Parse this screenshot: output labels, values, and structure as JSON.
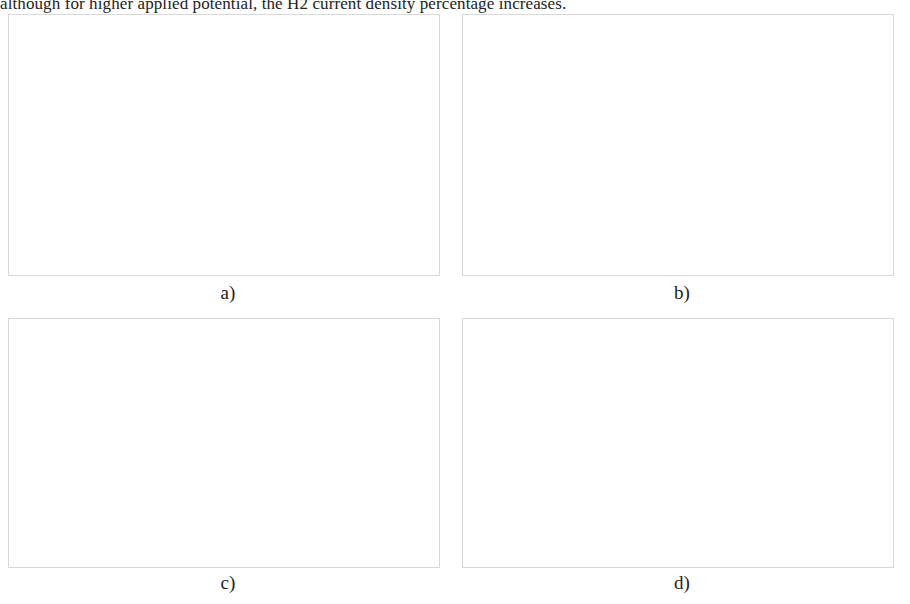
{
  "page": {
    "cropped_text_above": "although for higher applied potential, the H2 current density percentage increases."
  },
  "panels": [
    {
      "key": "a",
      "letter": "a)"
    },
    {
      "key": "b",
      "letter": "b)"
    },
    {
      "key": "c",
      "letter": "c)"
    },
    {
      "key": "d",
      "letter": "d)"
    }
  ],
  "chart_data": [
    {
      "id": "a",
      "type": "scatter",
      "title": "",
      "xlabel": "Applied cathode potential (V)",
      "ylabel": "CO current density (mA/cm²)",
      "xlim": [
        -1.75,
        -0.88
      ],
      "ylim": [
        0,
        100
      ],
      "xticks": [
        -1.7,
        -1.5,
        -1.3,
        -1.1,
        -0.9
      ],
      "xticklabels": [
        "-1.7",
        "-1.5",
        "-1.3",
        "-1.1",
        "-0.9"
      ],
      "yticks": [
        0,
        10,
        20,
        30,
        40,
        50,
        60,
        70,
        80,
        90,
        100
      ],
      "yticklabels": [
        "0",
        "10",
        "20",
        "30",
        "40",
        "50",
        "60",
        "70",
        "80",
        "90",
        "100"
      ],
      "y_axis_side": "right",
      "grid": false,
      "legend_position": "top-center",
      "legend": [
        {
          "label": "Exp Data [Verma et al., 2016]",
          "style": "marker"
        },
        {
          "label": "Model (0.5M KHCO₃)",
          "style": "solid"
        },
        {
          "label": "Model (30% (w/w) MEA)",
          "style": "dashed"
        }
      ],
      "series": [
        {
          "name": "Exp Data [Verma et al., 2016]",
          "style": "marker",
          "x": [
            -1.65,
            -1.54,
            -1.4,
            -1.27,
            -1.13,
            -0.98
          ],
          "y": [
            69,
            47,
            29.5,
            13.5,
            4.5,
            1.5
          ],
          "yerr": [
            9.5,
            6.5,
            3.0,
            0.0,
            0.0,
            0.0
          ]
        },
        {
          "name": "Model (0.5M KHCO₃)",
          "style": "solid",
          "x": [
            -1.7,
            -1.65,
            -1.6,
            -1.55,
            -1.5,
            -1.45,
            -1.4,
            -1.35,
            -1.3,
            -1.25,
            -1.2,
            -1.15,
            -1.1,
            -1.05,
            -1.0,
            -0.96
          ],
          "y": [
            65,
            59,
            53,
            47,
            41,
            35.5,
            30,
            25,
            20.5,
            16,
            12.5,
            9,
            6,
            4,
            2.5,
            2
          ]
        },
        {
          "name": "Model (30% (w/w) MEA)",
          "style": "dashed",
          "x": [
            -1.62,
            -1.58,
            -1.54,
            -1.5,
            -1.46,
            -1.42,
            -1.38,
            -1.34,
            -1.3,
            -1.26,
            -1.22,
            -1.18,
            -1.14,
            -1.1,
            -1.06,
            -1.02,
            -0.98,
            -0.96
          ],
          "y": [
            90,
            82,
            74,
            66,
            58,
            51,
            44,
            38,
            32,
            26.5,
            21.5,
            17,
            13.5,
            10.5,
            8,
            6.5,
            5.5,
            5.5
          ]
        }
      ]
    },
    {
      "id": "b",
      "type": "scatter",
      "title": "",
      "xlabel": "Applied cathode potential (V)",
      "ylabel": "H₂ current density (mA/cm²)",
      "xlim": [
        -1.75,
        -0.88
      ],
      "ylim": [
        0,
        6
      ],
      "xticks": [
        -1.7,
        -1.5,
        -1.3,
        -1.1,
        -0.9
      ],
      "xticklabels": [
        "-1.7",
        "-1.5",
        "-1.3",
        "-1.1",
        "-0.9"
      ],
      "yticks": [
        0,
        1,
        2,
        3,
        4,
        5,
        6
      ],
      "yticklabels": [
        "0",
        "1",
        "2",
        "3",
        "4",
        "5",
        "6"
      ],
      "y_axis_side": "right",
      "grid": false,
      "legend_position": "top-center",
      "legend": [
        {
          "label": "Exp Data [Verma et al., 2016]",
          "style": "marker"
        },
        {
          "label": "Model (0.5M KHCO₃)",
          "style": "solid"
        },
        {
          "label": "Model (30% (w/w) MEA)",
          "style": "dashed"
        }
      ],
      "series": [
        {
          "name": "Exp Data [Verma et al., 2016]",
          "style": "marker",
          "x": [
            -1.65,
            -1.54,
            -1.4,
            -1.27,
            -1.1,
            -0.95
          ],
          "y": [
            1.95,
            1.25,
            1.45,
            0.8,
            0.28,
            0.2
          ],
          "yerr": [
            0.22,
            0.12,
            0.18,
            0.0,
            0.0,
            0.0
          ]
        },
        {
          "name": "Model (0.5M KHCO₃)",
          "style": "solid",
          "x": [
            -1.7,
            -1.65,
            -1.6,
            -1.55,
            -1.5,
            -1.45,
            -1.4,
            -1.35,
            -1.3,
            -1.25,
            -1.2,
            -1.15,
            -1.1,
            -1.05,
            -1.0,
            -0.96
          ],
          "y": [
            2.95,
            2.6,
            2.28,
            1.98,
            1.7,
            1.45,
            1.22,
            1.02,
            0.84,
            0.68,
            0.54,
            0.42,
            0.32,
            0.24,
            0.18,
            0.15
          ]
        },
        {
          "name": "Model (30% (w/w) MEA)",
          "style": "dashed",
          "x": [
            -1.7,
            -1.66,
            -1.62,
            -1.58,
            -1.54,
            -1.5,
            -1.46,
            -1.42,
            -1.38,
            -1.34,
            -1.3,
            -1.25,
            -1.2,
            -1.15,
            -1.1,
            -1.05,
            -1.0,
            -0.96
          ],
          "y": [
            4.95,
            4.3,
            3.7,
            3.12,
            2.58,
            2.05,
            1.62,
            1.28,
            1.0,
            0.8,
            0.64,
            0.5,
            0.38,
            0.28,
            0.2,
            0.15,
            0.11,
            0.09
          ]
        }
      ]
    },
    {
      "id": "c",
      "type": "line",
      "title": "",
      "xlabel": "Feed flowrate (cm³/min)",
      "ylabel": "CO current density (mA/cm²)",
      "y2label": "CO₂ conversion (%)",
      "xlim": [
        0,
        22
      ],
      "ylim": [
        0,
        70
      ],
      "y2lim": [
        0,
        80
      ],
      "xticks": [
        0,
        5,
        10,
        15,
        20
      ],
      "xticklabels": [
        "0",
        "5",
        "10",
        "15",
        "20"
      ],
      "yticks": [
        0,
        10,
        20,
        30,
        40,
        50,
        60,
        70
      ],
      "yticklabels": [
        "0",
        "10",
        "20",
        "30",
        "40",
        "50",
        "60",
        "70"
      ],
      "y2ticks": [
        0,
        10,
        20,
        30,
        40,
        50,
        60,
        70,
        80
      ],
      "y2ticklabels": [
        "0",
        "10",
        "20",
        "30",
        "40",
        "50",
        "60",
        "70",
        "80"
      ],
      "grid": false,
      "legend_position": "center-right",
      "legend": [
        {
          "label": "current (KHCO₃)",
          "style": "solid"
        },
        {
          "label": "current (MEA)",
          "style": "dashed"
        },
        {
          "label": "conversion (KHCO₃)",
          "style": "dashdot"
        },
        {
          "label": "conversion (MEA)",
          "style": "dotted"
        }
      ],
      "series": [
        {
          "name": "current (KHCO₃)",
          "style": "solid",
          "axis": "left",
          "x": [
            2,
            3,
            4,
            5,
            6,
            7,
            8,
            9,
            10,
            11,
            12,
            13,
            14,
            15,
            16,
            17,
            18,
            19,
            20
          ],
          "y": [
            5.5,
            10.5,
            15.5,
            20.0,
            23.0,
            25.0,
            26.5,
            27.6,
            28.5,
            29.2,
            29.8,
            30.3,
            30.7,
            31.0,
            31.3,
            31.6,
            31.8,
            32.0,
            32.2
          ]
        },
        {
          "name": "current (MEA)",
          "style": "dashed",
          "axis": "left",
          "x": [
            2,
            3,
            4,
            5,
            6,
            7,
            8,
            9,
            10,
            11,
            12,
            13,
            14,
            15,
            16,
            17,
            18,
            19,
            20
          ],
          "y": [
            11.5,
            19.0,
            26.5,
            33.5,
            39.5,
            44.0,
            47.5,
            50.5,
            53.0,
            55.0,
            56.5,
            57.8,
            58.8,
            59.5,
            60.1,
            60.5,
            60.8,
            61.0,
            61.1
          ]
        },
        {
          "name": "conversion (KHCO₃)",
          "style": "dashdot",
          "axis": "right",
          "x": [
            2,
            2.5,
            3,
            3.5,
            4,
            5,
            6,
            7,
            8,
            9,
            10,
            11,
            12,
            13,
            14,
            15,
            16,
            17,
            18,
            19,
            20
          ],
          "y": [
            69,
            62,
            54,
            46,
            40,
            31,
            26,
            22,
            19,
            17,
            15.5,
            14,
            13,
            12.2,
            11.6,
            11.1,
            10.7,
            10.4,
            10.2,
            10.05,
            10.0
          ]
        },
        {
          "name": "conversion (MEA)",
          "style": "dotted",
          "axis": "right",
          "x": [
            2,
            2.5,
            3,
            3.5,
            4,
            5,
            6,
            7,
            8,
            9,
            10,
            11,
            12,
            13,
            14,
            15,
            16,
            17,
            18,
            19,
            20
          ],
          "y": [
            38,
            34,
            30,
            26,
            23,
            18,
            15,
            12.5,
            10.8,
            9.5,
            8.5,
            7.7,
            7.1,
            6.6,
            6.2,
            5.9,
            5.7,
            5.55,
            5.45,
            5.4,
            5.35
          ]
        }
      ]
    },
    {
      "id": "d",
      "type": "line",
      "title": "",
      "xlabel": "Feed flowrate (cm³/min)",
      "ylabel": "Faradaic efficiency (%)",
      "xlim": [
        0,
        22
      ],
      "ylim": [
        84,
        100
      ],
      "xticks": [
        0,
        5,
        10,
        15,
        20
      ],
      "xticklabels": [
        "0",
        "5",
        "10",
        "15",
        "20"
      ],
      "yticks": [
        84,
        86,
        88,
        90,
        92,
        94,
        96,
        98,
        100
      ],
      "yticklabels": [
        "84",
        "86",
        "88",
        "90",
        "92",
        "94",
        "96",
        "98",
        "100"
      ],
      "grid": false,
      "legend_position": "center-right",
      "legend": [
        {
          "label": "KHCO₃",
          "style": "solid"
        },
        {
          "label": "MEA",
          "style": "dashed"
        }
      ],
      "series": [
        {
          "name": "KHCO₃",
          "style": "solid",
          "x": [
            2,
            2.5,
            3,
            3.5,
            4,
            4.5,
            5,
            6,
            7,
            8,
            9,
            10,
            11,
            12,
            13,
            14,
            15,
            16,
            17,
            18,
            19,
            20
          ],
          "y": [
            86.35,
            87.6,
            88.7,
            89.7,
            90.6,
            91.3,
            91.9,
            92.8,
            93.5,
            94.1,
            94.6,
            95.0,
            95.3,
            95.55,
            95.75,
            95.9,
            96.0,
            96.08,
            96.14,
            96.18,
            96.21,
            96.23
          ]
        },
        {
          "name": "MEA",
          "style": "dashed",
          "x": [
            2,
            2.5,
            3,
            3.5,
            4,
            4.5,
            5,
            6,
            7,
            8,
            9,
            10,
            11,
            12,
            13,
            14,
            15,
            16,
            17,
            18,
            19,
            20
          ],
          "y": [
            87.75,
            88.9,
            89.9,
            90.8,
            91.6,
            92.3,
            92.85,
            93.7,
            94.4,
            95.0,
            95.5,
            95.9,
            96.3,
            96.6,
            96.9,
            97.15,
            97.35,
            97.5,
            97.65,
            97.75,
            97.83,
            97.9
          ]
        }
      ]
    }
  ]
}
